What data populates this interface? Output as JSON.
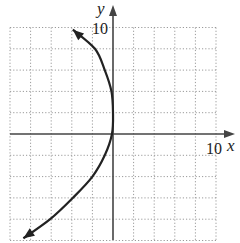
{
  "chart_data": {
    "type": "line",
    "title": "",
    "xlabel": "x",
    "ylabel": "y",
    "xlim": [
      -10,
      10
    ],
    "ylim": [
      -10,
      10
    ],
    "grid": true,
    "grid_step": 2,
    "tick_labels": {
      "x": "10",
      "y": "10"
    },
    "series": [
      {
        "name": "curve",
        "description": "Parabola opening left, vertex near the y-axis around y≈2, arrows at both ends",
        "points": [
          {
            "x": -3.9,
            "y": 9.8
          },
          {
            "x": -1.75,
            "y": 8
          },
          {
            "x": -0.8,
            "y": 6
          },
          {
            "x": -0.15,
            "y": 4
          },
          {
            "x": 0,
            "y": 2
          },
          {
            "x": -0.1,
            "y": 0
          },
          {
            "x": -0.8,
            "y": -2
          },
          {
            "x": -2.0,
            "y": -4
          },
          {
            "x": -3.9,
            "y": -6
          },
          {
            "x": -6.1,
            "y": -8
          },
          {
            "x": -8.7,
            "y": -9.8
          }
        ]
      }
    ]
  },
  "labels": {
    "x_axis": "x",
    "y_axis": "y",
    "x_tick": "10",
    "y_tick": "10"
  },
  "colors": {
    "curve": "#222222",
    "axis": "#444444",
    "grid": "#9a9a9a"
  }
}
